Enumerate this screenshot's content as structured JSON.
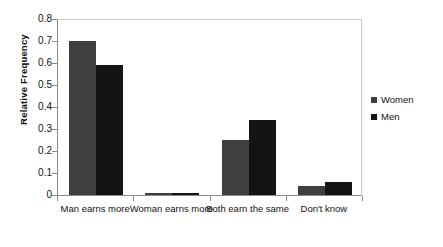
{
  "chart_data": {
    "type": "bar",
    "title": "",
    "xlabel": "",
    "ylabel": "Relative Frequency",
    "ylim": [
      0,
      0.8
    ],
    "ytick_labels": [
      "0.8",
      "0.7",
      "0.6",
      "0.5",
      "0.4",
      "0.3",
      "0.2",
      "0.1",
      "0"
    ],
    "ytick_values": [
      0.8,
      0.7,
      0.6,
      0.5,
      0.4,
      0.3,
      0.2,
      0.1,
      0
    ],
    "grid": false,
    "legend_position": "right",
    "categories": [
      "Man earns more",
      "Woman earns more",
      "Both earn the same",
      "Don't know"
    ],
    "series": [
      {
        "name": "Women",
        "color": "#3f3f3f",
        "values": [
          0.7,
          0.01,
          0.25,
          0.04
        ]
      },
      {
        "name": "Men",
        "color": "#141414",
        "values": [
          0.59,
          0.01,
          0.34,
          0.06
        ]
      }
    ]
  },
  "legend": {
    "items": [
      {
        "label": "Women"
      },
      {
        "label": "Men"
      }
    ]
  }
}
